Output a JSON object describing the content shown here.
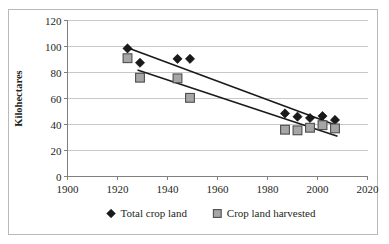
{
  "chart_data": {
    "type": "scatter",
    "title": "",
    "xlabel": "",
    "ylabel": "Kilohectares",
    "xlim": [
      1900,
      2020
    ],
    "ylim": [
      0,
      120
    ],
    "xticks": [
      1900,
      1920,
      1940,
      1960,
      1980,
      2000,
      2020
    ],
    "yticks": [
      0,
      20,
      40,
      60,
      80,
      100,
      120
    ],
    "grid": "horizontal",
    "legend_position": "bottom",
    "series": [
      {
        "name": "Total crop land",
        "marker": "diamond",
        "color": "#1a1a1a",
        "points": [
          {
            "x": 1924,
            "y": 98.5
          },
          {
            "x": 1929,
            "y": 87.5
          },
          {
            "x": 1944,
            "y": 90.5
          },
          {
            "x": 1949,
            "y": 90.5
          },
          {
            "x": 1987,
            "y": 48.5
          },
          {
            "x": 1992,
            "y": 46.0
          },
          {
            "x": 1997,
            "y": 45.0
          },
          {
            "x": 2002,
            "y": 46.5
          },
          {
            "x": 2007,
            "y": 43.5
          }
        ],
        "trendline": {
          "x1": 1924,
          "y1": 99.0,
          "x2": 2008,
          "y2": 39.0
        }
      },
      {
        "name": "Crop land harvested",
        "marker": "square",
        "color": "#a6a6a6",
        "points": [
          {
            "x": 1924,
            "y": 91.0
          },
          {
            "x": 1929,
            "y": 76.0
          },
          {
            "x": 1944,
            "y": 75.5
          },
          {
            "x": 1949,
            "y": 60.5
          },
          {
            "x": 1987,
            "y": 36.0
          },
          {
            "x": 1992,
            "y": 35.5
          },
          {
            "x": 1997,
            "y": 37.5
          },
          {
            "x": 2002,
            "y": 39.5
          },
          {
            "x": 2007,
            "y": 37.0
          }
        ],
        "trendline": {
          "x1": 1928,
          "y1": 82.0,
          "x2": 2008,
          "y2": 31.0
        }
      }
    ]
  },
  "axis": {
    "y_title": "Kilohectares",
    "y_tick_labels": [
      "120",
      "100",
      "80",
      "60",
      "40",
      "20",
      "0"
    ],
    "x_tick_labels": [
      "1900",
      "1920",
      "1940",
      "1960",
      "1980",
      "2000",
      "2020"
    ]
  },
  "legend": {
    "items": [
      {
        "label": "Total crop land",
        "marker": "diamond-marker",
        "color": "#1a1a1a"
      },
      {
        "label": "Crop land harvested",
        "marker": "square-marker",
        "color": "#a6a6a6"
      }
    ]
  },
  "colors": {
    "frame_border": "#b9b9b9",
    "gridline": "#c8c8c8",
    "axis_line": "#7f7f7f",
    "series_black": "#1a1a1a",
    "series_gray": "#a6a6a6",
    "marker_stroke": "#4d4d4d",
    "trendline": "#1a1a1a",
    "text": "#231f20"
  }
}
